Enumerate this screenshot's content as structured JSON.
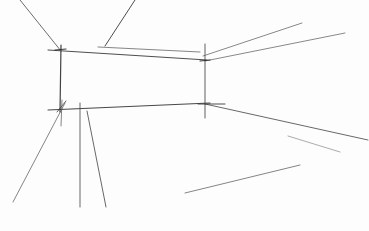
{
  "image": {
    "description": "Pencil perspective sketch of an empty room interior (back wall, ceiling and floor guide lines)",
    "width": 369,
    "height": 231,
    "background": "#fdfdfd",
    "stroke_color": "#3a3a3a",
    "light_stroke_color": "#7a7a7a"
  },
  "lines": [
    {
      "name": "back-wall-left-edge",
      "x1": 61,
      "y1": 45,
      "x2": 60,
      "y2": 112,
      "w": 1.2,
      "c": "#2e2e2e"
    },
    {
      "name": "back-wall-right-edge",
      "x1": 205,
      "y1": 44,
      "x2": 205,
      "y2": 118,
      "w": 0.9,
      "c": "#3a3a3a"
    },
    {
      "name": "back-wall-top-edge",
      "x1": 48,
      "y1": 50,
      "x2": 207,
      "y2": 60,
      "w": 1.0,
      "c": "#3a3a3a"
    },
    {
      "name": "ceiling-guide-short",
      "x1": 98,
      "y1": 47,
      "x2": 200,
      "y2": 52,
      "w": 0.8,
      "c": "#555555"
    },
    {
      "name": "back-wall-bottom-edge",
      "x1": 48,
      "y1": 110,
      "x2": 210,
      "y2": 103,
      "w": 1.1,
      "c": "#333333"
    },
    {
      "name": "ceiling-left-diagonal",
      "x1": 20,
      "y1": 0,
      "x2": 61,
      "y2": 51,
      "w": 0.9,
      "c": "#4a4a4a"
    },
    {
      "name": "ceiling-middle-diagonal",
      "x1": 135,
      "y1": 0,
      "x2": 105,
      "y2": 46,
      "w": 1.0,
      "c": "#3a3a3a"
    },
    {
      "name": "ceiling-right-upper",
      "x1": 203,
      "y1": 56,
      "x2": 302,
      "y2": 23,
      "w": 0.8,
      "c": "#5a5a5a"
    },
    {
      "name": "ceiling-right-lower",
      "x1": 205,
      "y1": 61,
      "x2": 345,
      "y2": 33,
      "w": 0.8,
      "c": "#5a5a5a"
    },
    {
      "name": "floor-right-edge",
      "x1": 205,
      "y1": 104,
      "x2": 368,
      "y2": 140,
      "w": 0.9,
      "c": "#444444"
    },
    {
      "name": "floor-right-short",
      "x1": 288,
      "y1": 136,
      "x2": 340,
      "y2": 152,
      "w": 0.7,
      "c": "#7a7a7a"
    },
    {
      "name": "floor-left-diagonal",
      "x1": 65,
      "y1": 103,
      "x2": 13,
      "y2": 202,
      "w": 0.8,
      "c": "#555555"
    },
    {
      "name": "floor-vertical-1",
      "x1": 80,
      "y1": 103,
      "x2": 80,
      "y2": 207,
      "w": 0.9,
      "c": "#444444"
    },
    {
      "name": "floor-vertical-2",
      "x1": 87,
      "y1": 111,
      "x2": 106,
      "y2": 207,
      "w": 0.9,
      "c": "#444444"
    },
    {
      "name": "floor-lower-diagonal",
      "x1": 185,
      "y1": 193,
      "x2": 300,
      "y2": 165,
      "w": 0.8,
      "c": "#555555"
    },
    {
      "name": "corner-tick-left-top",
      "x1": 55,
      "y1": 50,
      "x2": 66,
      "y2": 49,
      "w": 1.2,
      "c": "#2a2a2a"
    },
    {
      "name": "corner-tick-right-top",
      "x1": 200,
      "y1": 61,
      "x2": 210,
      "y2": 60,
      "w": 1.2,
      "c": "#2a2a2a"
    },
    {
      "name": "corner-tick-right-bottom",
      "x1": 198,
      "y1": 104,
      "x2": 225,
      "y2": 104,
      "w": 1.0,
      "c": "#3a3a3a"
    },
    {
      "name": "corner-tick-left-bottom",
      "x1": 57,
      "y1": 112,
      "x2": 66,
      "y2": 101,
      "w": 0.9,
      "c": "#3a3a3a"
    },
    {
      "name": "short-tick-near-floor",
      "x1": 62,
      "y1": 100,
      "x2": 61,
      "y2": 126,
      "w": 0.8,
      "c": "#555555"
    }
  ]
}
